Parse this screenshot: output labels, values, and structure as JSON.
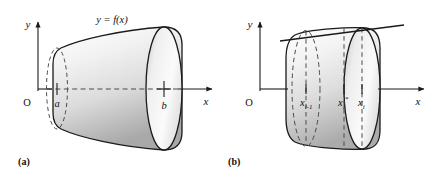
{
  "figure": {
    "type": "math-diagram",
    "background_color": "#ffffff",
    "stroke_color": "#1a1a1a",
    "fill_light": "#fcfcfc",
    "fill_dark": "#a8a8a8",
    "dashed_color": "#555555",
    "axis_color": "#222222"
  },
  "panels": [
    {
      "id": "a",
      "caption": "(a)",
      "axes": {
        "y_label": "y",
        "x_label": "x",
        "origin_label": "O"
      },
      "curve_label": "y = f(x)",
      "ticks": [
        {
          "label": "a",
          "marker": "tick"
        },
        {
          "label": "b",
          "marker": "plus"
        }
      ],
      "solid": {
        "shape": "frustum",
        "left_cap": "dashed-ellipse",
        "right_cap": "solid-ellipse",
        "axis_line": "dashed"
      }
    },
    {
      "id": "b",
      "caption": "(b)",
      "axes": {
        "y_label": "y",
        "x_label": "x",
        "origin_label": "O"
      },
      "tangent_line": "secant-over-top",
      "ticks": [
        {
          "label": "x",
          "sub": "i-1",
          "sup": ""
        },
        {
          "label": "x",
          "sub": "i",
          "sup": "*"
        },
        {
          "label": "x",
          "sub": "i",
          "sup": ""
        }
      ],
      "solid": {
        "shape": "cylinder-band",
        "left_cap": "dashed-ellipse",
        "right_cap": "solid-ellipse",
        "vertical_dashes": 3
      }
    }
  ]
}
